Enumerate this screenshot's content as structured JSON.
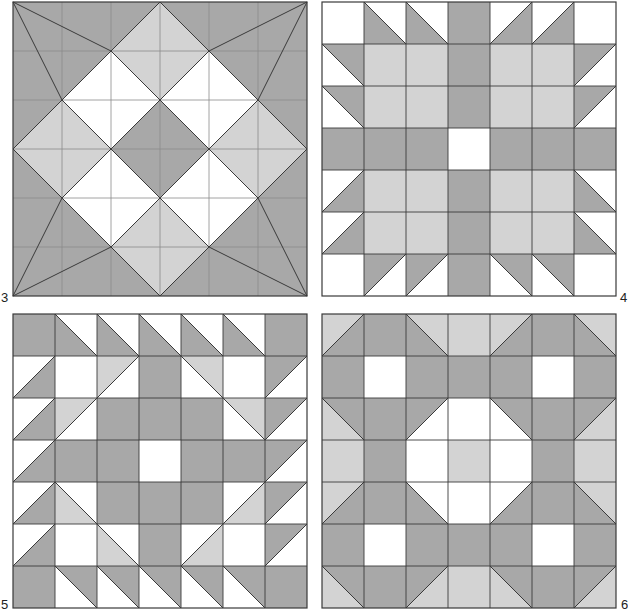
{
  "colors": {
    "dark": "#a8a8a8",
    "light": "#d3d3d3",
    "white": "#ffffff",
    "grid_line": "#8c8c8c",
    "edge_line": "#3a3a3a"
  },
  "panels": [
    {
      "id": "3",
      "label": "3",
      "type": "polygons",
      "x": 13,
      "y": 2,
      "size": 294,
      "units": 6,
      "label_pos": {
        "x": 1,
        "y": 291
      },
      "polygons": [
        {
          "fill": "D",
          "pts": [
            [
              0,
              0
            ],
            [
              6,
              0
            ],
            [
              6,
              6
            ],
            [
              0,
              6
            ]
          ]
        },
        {
          "fill": "L",
          "pts": [
            [
              3,
              0
            ],
            [
              4,
              1
            ],
            [
              3,
              2
            ],
            [
              2,
              1
            ]
          ]
        },
        {
          "fill": "L",
          "pts": [
            [
              0,
              3
            ],
            [
              1,
              2
            ],
            [
              2,
              3
            ],
            [
              1,
              4
            ]
          ]
        },
        {
          "fill": "L",
          "pts": [
            [
              6,
              3
            ],
            [
              5,
              2
            ],
            [
              4,
              3
            ],
            [
              5,
              4
            ]
          ]
        },
        {
          "fill": "L",
          "pts": [
            [
              3,
              6
            ],
            [
              2,
              5
            ],
            [
              3,
              4
            ],
            [
              4,
              5
            ]
          ]
        },
        {
          "fill": "W",
          "pts": [
            [
              2,
              1
            ],
            [
              3,
              2
            ],
            [
              2,
              3
            ],
            [
              1,
              2
            ]
          ]
        },
        {
          "fill": "W",
          "pts": [
            [
              4,
              1
            ],
            [
              5,
              2
            ],
            [
              4,
              3
            ],
            [
              3,
              2
            ]
          ]
        },
        {
          "fill": "W",
          "pts": [
            [
              2,
              3
            ],
            [
              3,
              4
            ],
            [
              2,
              5
            ],
            [
              1,
              4
            ]
          ]
        },
        {
          "fill": "W",
          "pts": [
            [
              4,
              3
            ],
            [
              5,
              4
            ],
            [
              4,
              5
            ],
            [
              3,
              4
            ]
          ]
        },
        {
          "fill": "D",
          "pts": [
            [
              3,
              2
            ],
            [
              4,
              3
            ],
            [
              3,
              4
            ],
            [
              2,
              3
            ]
          ]
        }
      ],
      "lines": [
        [
          [
            0,
            0
          ],
          [
            2,
            1
          ]
        ],
        [
          [
            0,
            0
          ],
          [
            1,
            2
          ]
        ],
        [
          [
            6,
            0
          ],
          [
            4,
            1
          ]
        ],
        [
          [
            6,
            0
          ],
          [
            5,
            2
          ]
        ],
        [
          [
            0,
            6
          ],
          [
            1,
            4
          ]
        ],
        [
          [
            0,
            6
          ],
          [
            2,
            5
          ]
        ],
        [
          [
            6,
            6
          ],
          [
            5,
            4
          ]
        ],
        [
          [
            6,
            6
          ],
          [
            4,
            5
          ]
        ],
        [
          [
            3,
            0
          ],
          [
            6,
            3
          ]
        ],
        [
          [
            6,
            3
          ],
          [
            3,
            6
          ]
        ],
        [
          [
            3,
            6
          ],
          [
            0,
            3
          ]
        ],
        [
          [
            0,
            3
          ],
          [
            3,
            0
          ]
        ],
        [
          [
            2,
            1
          ],
          [
            5,
            4
          ]
        ],
        [
          [
            4,
            1
          ],
          [
            1,
            4
          ]
        ],
        [
          [
            1,
            2
          ],
          [
            4,
            5
          ]
        ],
        [
          [
            5,
            2
          ],
          [
            2,
            5
          ]
        ]
      ]
    },
    {
      "id": "4",
      "label": "4",
      "type": "grid",
      "x": 322,
      "y": 2,
      "size": 294,
      "units": 7,
      "label_pos": {
        "x": 620,
        "y": 291
      },
      "cells": [
        [
          "W",
          "\\ D W",
          "\\ D W",
          "D",
          "/ W D",
          "/ W D",
          "W"
        ],
        [
          "\\ W D",
          "L",
          "L",
          "D",
          "L",
          "L",
          "/ D W"
        ],
        [
          "\\ W D",
          "L",
          "L",
          "D",
          "L",
          "L",
          "/ D W"
        ],
        [
          "D",
          "D",
          "D",
          "W",
          "D",
          "D",
          "D"
        ],
        [
          "/ W D",
          "L",
          "L",
          "D",
          "L",
          "L",
          "\\ D W"
        ],
        [
          "/ W D",
          "L",
          "L",
          "D",
          "L",
          "L",
          "\\ D W"
        ],
        [
          "W",
          "/ D W",
          "/ D W",
          "D",
          "\\ W D",
          "\\ W D",
          "W"
        ]
      ]
    },
    {
      "id": "5",
      "label": "5",
      "type": "grid",
      "x": 13,
      "y": 314,
      "size": 294,
      "units": 7,
      "label_pos": {
        "x": 1,
        "y": 598
      },
      "cells": [
        [
          "D",
          "\\ D W",
          "\\ D W",
          "\\ D W",
          "\\ D W",
          "\\ D W",
          "D"
        ],
        [
          "/ W D",
          "W",
          "/ L W",
          "D",
          "\\ W L",
          "W",
          "/ D W"
        ],
        [
          "/ W D",
          "/ L W",
          "D",
          "D",
          "D",
          "\\ W L",
          "/ D W"
        ],
        [
          "/ W D",
          "D",
          "D",
          "W",
          "D",
          "D",
          "/ D W"
        ],
        [
          "/ W D",
          "\\ L W",
          "D",
          "D",
          "D",
          "/ W L",
          "/ D W"
        ],
        [
          "/ W D",
          "W",
          "\\ L W",
          "D",
          "/ W L",
          "W",
          "/ D W"
        ],
        [
          "D",
          "\\ W D",
          "\\ W D",
          "\\ W D",
          "\\ W D",
          "\\ W D",
          "D"
        ]
      ]
    },
    {
      "id": "6",
      "label": "6",
      "type": "grid",
      "x": 322,
      "y": 314,
      "size": 294,
      "units": 7,
      "label_pos": {
        "x": 621,
        "y": 598
      },
      "cells": [
        [
          "/ L D",
          "D",
          "\\ D L",
          "L",
          "/ L D",
          "D",
          "\\ D L"
        ],
        [
          "D",
          "W",
          "D",
          "D",
          "D",
          "W",
          "D"
        ],
        [
          "\\ L D",
          "D",
          "/ D W",
          "W",
          "\\ W D",
          "D",
          "/ D L"
        ],
        [
          "L",
          "D",
          "W",
          "L",
          "W",
          "D",
          "L"
        ],
        [
          "/ L D",
          "D",
          "\\ D W",
          "W",
          "/ W D",
          "D",
          "\\ D L"
        ],
        [
          "D",
          "W",
          "D",
          "D",
          "D",
          "W",
          "D"
        ],
        [
          "\\ L D",
          "D",
          "/ D L",
          "L",
          "\\ L D",
          "D",
          "/ D L"
        ]
      ]
    }
  ]
}
